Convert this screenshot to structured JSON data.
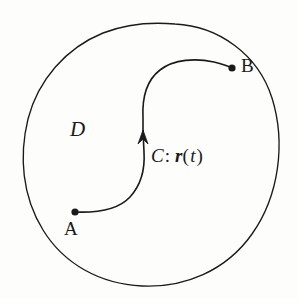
{
  "figure": {
    "background_color": "#fdfdfc",
    "stroke_color": "#1a1a1a",
    "labels": {
      "region": "D",
      "start_point": "A",
      "end_point": "B",
      "curve_name": "C",
      "curve_separator": ":",
      "curve_vector": "r",
      "curve_paren_open": "(",
      "curve_parameter": "t",
      "curve_paren_close": ")"
    },
    "geometry": {
      "region_boundary_description": "closed tilted oval loop",
      "curve_description": "S-shaped oriented arc with upward arrowhead",
      "point_A": {
        "x": 75,
        "y": 212
      },
      "point_B": {
        "x": 232,
        "y": 68
      },
      "arrow_tip": {
        "x": 143,
        "y": 131
      },
      "region_extents": {
        "left": 22,
        "right": 279,
        "top": 24,
        "bottom": 286
      }
    }
  }
}
